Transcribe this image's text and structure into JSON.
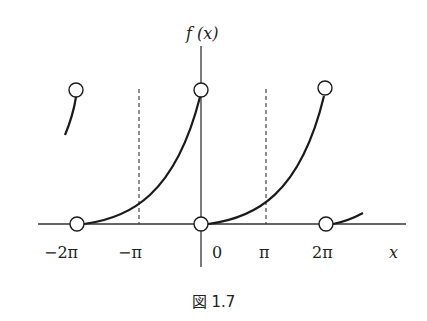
{
  "figure": {
    "ylabel": "f (x)",
    "xlabel": "x",
    "caption": "図 1.7",
    "ticks": [
      {
        "label": "−2π",
        "value": "-2pi"
      },
      {
        "label": "−π",
        "value": "-pi"
      },
      {
        "label": "0",
        "value": "0"
      },
      {
        "label": "π",
        "value": "pi"
      },
      {
        "label": "2π",
        "value": "2pi"
      }
    ],
    "open_circles": [
      {
        "x": "-2pi",
        "y": "top"
      },
      {
        "x": "0",
        "y": "top"
      },
      {
        "x": "2pi",
        "y": "top"
      },
      {
        "x": "-2pi",
        "y": "0"
      },
      {
        "x": "0",
        "y": "0"
      },
      {
        "x": "2pi",
        "y": "0"
      }
    ],
    "dashed_lines": [
      "-pi",
      "pi"
    ],
    "colors": {
      "curve": "#1a1a1a",
      "axis": "#333333",
      "background": "#ffffff"
    }
  }
}
